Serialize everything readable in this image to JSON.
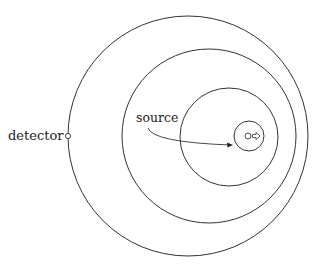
{
  "diagram": {
    "labels": {
      "detector": "detector",
      "source": "source"
    },
    "colors": {
      "stroke": "#333333",
      "background": "#ffffff"
    },
    "wavefronts": [
      {
        "name": "outer",
        "cx": 188,
        "cy": 136,
        "r": 120
      },
      {
        "name": "second",
        "cx": 209,
        "cy": 136,
        "r": 87
      },
      {
        "name": "third",
        "cx": 229,
        "cy": 137,
        "r": 49
      },
      {
        "name": "innermost",
        "cx": 249,
        "cy": 136,
        "r": 15
      }
    ],
    "source_direction": "right-arrow"
  }
}
